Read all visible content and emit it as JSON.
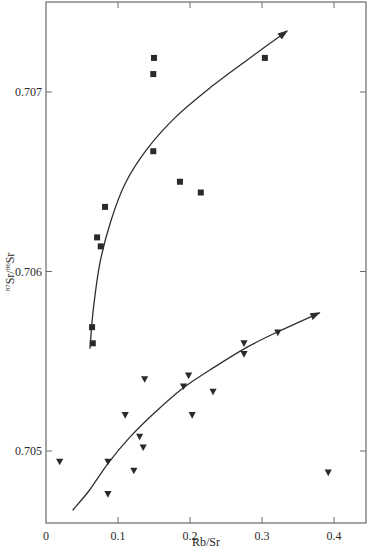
{
  "chart_data": {
    "type": "scatter",
    "title": "",
    "xlabel": "Rb/Sr",
    "ylabel_parts": {
      "sup1": "87",
      "main1": "Sr/",
      "sup2": "86",
      "main2": "Sr"
    },
    "ylabel": "87Sr/86Sr",
    "xlim": [
      0,
      0.445
    ],
    "ylim": [
      0.70462,
      0.70751
    ],
    "x_ticks": [
      0,
      0.1,
      0.2,
      0.3,
      0.4
    ],
    "x_tick_labels": [
      "0",
      "0.1",
      "0.2",
      "0.3",
      "0.4"
    ],
    "y_ticks": [
      0.705,
      0.706,
      0.707
    ],
    "y_tick_labels": [
      "0.705",
      "0.706",
      "0.707"
    ],
    "grid": false,
    "legend": "none",
    "series": [
      {
        "name": "square-series",
        "marker": "square",
        "points": [
          {
            "x": 0.15,
            "y": 0.70719
          },
          {
            "x": 0.149,
            "y": 0.7071
          },
          {
            "x": 0.149,
            "y": 0.70667
          },
          {
            "x": 0.082,
            "y": 0.70636
          },
          {
            "x": 0.071,
            "y": 0.70619
          },
          {
            "x": 0.076,
            "y": 0.70614
          },
          {
            "x": 0.186,
            "y": 0.7065
          },
          {
            "x": 0.215,
            "y": 0.70644
          },
          {
            "x": 0.304,
            "y": 0.70719
          },
          {
            "x": 0.064,
            "y": 0.70569
          },
          {
            "x": 0.065,
            "y": 0.7056
          }
        ],
        "trend_curve": [
          {
            "x": 0.061,
            "y": 0.70557
          },
          {
            "x": 0.066,
            "y": 0.7058
          },
          {
            "x": 0.075,
            "y": 0.70605
          },
          {
            "x": 0.09,
            "y": 0.70628
          },
          {
            "x": 0.11,
            "y": 0.70649
          },
          {
            "x": 0.14,
            "y": 0.70668
          },
          {
            "x": 0.18,
            "y": 0.70686
          },
          {
            "x": 0.23,
            "y": 0.70703
          },
          {
            "x": 0.28,
            "y": 0.70718
          },
          {
            "x": 0.335,
            "y": 0.70734
          }
        ]
      },
      {
        "name": "triangle-series",
        "marker": "triangle-down",
        "points": [
          {
            "x": 0.019,
            "y": 0.70494
          },
          {
            "x": 0.086,
            "y": 0.70494
          },
          {
            "x": 0.086,
            "y": 0.70476
          },
          {
            "x": 0.11,
            "y": 0.7052
          },
          {
            "x": 0.122,
            "y": 0.70489
          },
          {
            "x": 0.13,
            "y": 0.70508
          },
          {
            "x": 0.135,
            "y": 0.70502
          },
          {
            "x": 0.137,
            "y": 0.7054
          },
          {
            "x": 0.191,
            "y": 0.70536
          },
          {
            "x": 0.198,
            "y": 0.70542
          },
          {
            "x": 0.203,
            "y": 0.7052
          },
          {
            "x": 0.232,
            "y": 0.70533
          },
          {
            "x": 0.275,
            "y": 0.7056
          },
          {
            "x": 0.275,
            "y": 0.70554
          },
          {
            "x": 0.322,
            "y": 0.70566
          },
          {
            "x": 0.392,
            "y": 0.70488
          }
        ],
        "trend_curve": [
          {
            "x": 0.037,
            "y": 0.70467
          },
          {
            "x": 0.06,
            "y": 0.70478
          },
          {
            "x": 0.086,
            "y": 0.70493
          },
          {
            "x": 0.115,
            "y": 0.70507
          },
          {
            "x": 0.15,
            "y": 0.70521
          },
          {
            "x": 0.19,
            "y": 0.70535
          },
          {
            "x": 0.235,
            "y": 0.70547
          },
          {
            "x": 0.28,
            "y": 0.70558
          },
          {
            "x": 0.325,
            "y": 0.70567
          },
          {
            "x": 0.38,
            "y": 0.70577
          }
        ]
      }
    ]
  }
}
